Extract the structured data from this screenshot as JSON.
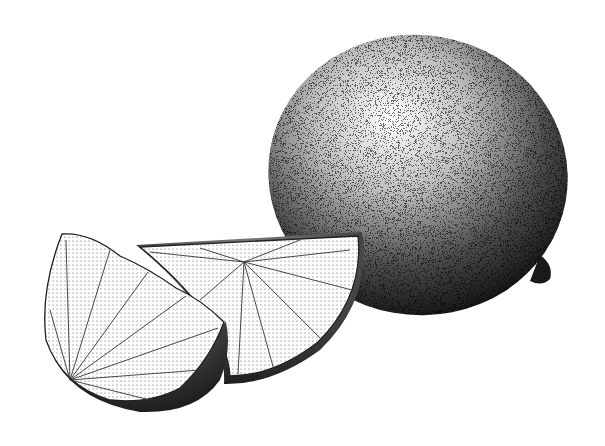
{
  "illustration": {
    "style": "stippled ink drawing",
    "background": "#ffffff",
    "ink": "#111111",
    "objects": [
      {
        "name": "whole-lime",
        "cx": 418,
        "cy": 175,
        "rx": 150,
        "ry": 140,
        "rotation": 10
      },
      {
        "name": "lime-wedge-left",
        "pivot": [
          133,
          305
        ]
      },
      {
        "name": "lime-wedge-right",
        "pivot": [
          240,
          265
        ]
      }
    ]
  }
}
